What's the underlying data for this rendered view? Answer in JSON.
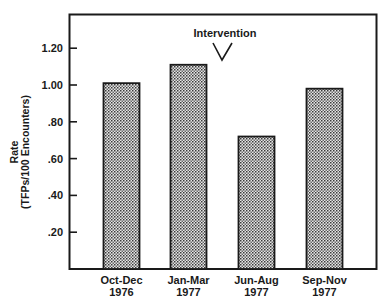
{
  "chart_data": {
    "type": "bar",
    "title": "",
    "categories": [
      "Oct-Dec 1976",
      "Jan-Mar 1977",
      "Jun-Aug 1977",
      "Sep-Nov 1977"
    ],
    "category_lines": [
      [
        "Oct-Dec",
        "1976"
      ],
      [
        "Jan-Mar",
        "1977"
      ],
      [
        "Jun-Aug",
        "1977"
      ],
      [
        "Sep-Nov",
        "1977"
      ]
    ],
    "values": [
      1.01,
      1.11,
      0.72,
      0.98
    ],
    "xlabel": "",
    "ylabel": "Rate (TFPs/100 Encounters)",
    "ylabel_lines": [
      "Rate",
      "(TFPs/100 Encounters)"
    ],
    "ylim": [
      0,
      1.39
    ],
    "yticks": [
      0.2,
      0.4,
      0.6,
      0.8,
      1.0,
      1.2
    ],
    "ytick_labels": [
      ".20",
      ".40",
      ".60",
      ".80",
      "1.00",
      "1.20"
    ],
    "grid": false,
    "legend": null,
    "annotations": [
      {
        "text": "Intervention",
        "between": [
          "Jan-Mar 1977",
          "Jun-Aug 1977"
        ],
        "marker": "V-shaped arrow pointing down"
      }
    ],
    "bar_fill": "stippled gray pattern",
    "bar_edge_color": "#1a1a1a"
  }
}
